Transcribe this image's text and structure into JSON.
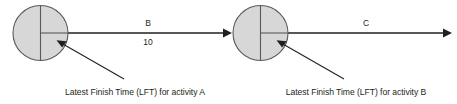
{
  "diagram": {
    "type": "activity-on-arrow-network",
    "background_color": "#ffffff",
    "node_fill_color": "#d7d7d7",
    "node_stroke_color": "#58595b",
    "line_color": "#231f20",
    "nodes": [
      {
        "id": "node-a",
        "name": "event-node-a",
        "cx": 40.5,
        "cy": 33,
        "r": 27.5,
        "divider_vertical": true,
        "divider_horizontal_right": true
      },
      {
        "id": "node-b",
        "name": "event-node-b",
        "cx": 260.5,
        "cy": 33,
        "r": 27.5,
        "divider_vertical": true,
        "divider_horizontal_right": true
      }
    ],
    "arrows": [
      {
        "id": "arrow-b",
        "name": "activity-arrow-b",
        "label": "B",
        "duration": "10",
        "x1": 40.5,
        "x2": 232,
        "y": 33
      },
      {
        "id": "arrow-c",
        "name": "activity-arrow-c",
        "label": "C",
        "duration": "",
        "x1": 260.5,
        "x2": 452,
        "y": 33
      }
    ],
    "annotations": [
      {
        "id": "annotation-a",
        "name": "lft-annotation-a",
        "text": "Latest Finish Time (LFT) for activity A",
        "text_x": 135,
        "text_y": 95,
        "pointer_from_x": 124,
        "pointer_from_y": 79,
        "pointer_to_x": 57,
        "pointer_to_y": 40
      },
      {
        "id": "annotation-b",
        "name": "lft-annotation-b",
        "text": "Latest Finish Time (LFT) for activity B",
        "text_x": 356,
        "text_y": 95,
        "pointer_from_x": 344,
        "pointer_from_y": 79,
        "pointer_to_x": 277,
        "pointer_to_y": 40
      }
    ]
  },
  "labels": {
    "arc_b": "B",
    "duration_b": "10",
    "arc_c": "C",
    "caption_a": "Latest Finish Time (LFT) for activity A",
    "caption_b": "Latest Finish Time (LFT) for activity B"
  }
}
